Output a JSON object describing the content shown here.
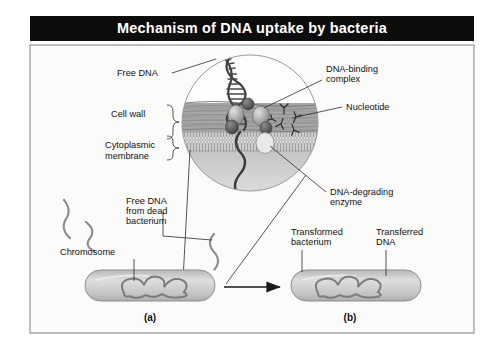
{
  "figure": {
    "title": "Mechanism of DNA uptake by bacteria",
    "title_bar_color": "#0d0d0d",
    "title_text_color": "#ffffff",
    "frame_border_color": "#8a8a8a",
    "background_color": "#fbfbfa",
    "panel_captions": [
      {
        "id": "a",
        "label": "(a)"
      },
      {
        "id": "b",
        "label": "(b)"
      }
    ],
    "labels": [
      {
        "name": "free-dna",
        "lines": [
          "Free DNA"
        ],
        "x": 117,
        "y": 76,
        "anchor": "start"
      },
      {
        "name": "cell-wall",
        "lines": [
          "Cell wall"
        ],
        "x": 111,
        "y": 117,
        "anchor": "start"
      },
      {
        "name": "cytoplasmic-membrane",
        "lines": [
          "Cytoplasmic",
          "membrane"
        ],
        "x": 105,
        "y": 148,
        "anchor": "start"
      },
      {
        "name": "dna-binding-complex",
        "lines": [
          "DNA-binding",
          "complex"
        ],
        "x": 326,
        "y": 72,
        "anchor": "start"
      },
      {
        "name": "nucleotide",
        "lines": [
          "Nucleotide"
        ],
        "x": 346,
        "y": 107,
        "anchor": "start"
      },
      {
        "name": "dna-degrading-enzyme",
        "lines": [
          "DNA-degrading",
          "enzyme"
        ],
        "x": 330,
        "y": 192,
        "anchor": "start"
      },
      {
        "name": "free-dna-dead-bact",
        "lines": [
          "Free DNA",
          "from dead",
          "bacterium"
        ],
        "x": 126,
        "y": 204,
        "anchor": "start"
      },
      {
        "name": "chromosome",
        "lines": [
          "Chromosome"
        ],
        "x": 60,
        "y": 255,
        "anchor": "start"
      },
      {
        "name": "transformed-bacterium",
        "lines": [
          "Transformed",
          "bacterium"
        ],
        "x": 291,
        "y": 235,
        "anchor": "start"
      },
      {
        "name": "transferred-dna",
        "lines": [
          "Transferred",
          "DNA"
        ],
        "x": 376,
        "y": 235,
        "anchor": "start"
      }
    ],
    "colors": {
      "cell_wall": "#9a9a9a",
      "membrane": "#b9b9b9",
      "cytoplasm": "#cfcfcf",
      "bacterium_body": "#c9c9c9",
      "bacterium_edge": "#8d8d8d",
      "dna_strand": "#4a4a4a",
      "protein_complex": "#8f8f8f",
      "leader_line": "#2b2b2b",
      "arrow": "#1a1a1a"
    },
    "diagram_type": "biological-process-illustration",
    "structures": [
      "double-stranded free DNA helix",
      "cell wall fibrous layers",
      "cytoplasmic membrane lipid bilayer",
      "DNA-binding complex proteins",
      "DNA-degrading enzyme",
      "single-stranded DNA entering cytoplasm",
      "bacterial chromosome",
      "transformed bacterium with transferred DNA"
    ]
  }
}
